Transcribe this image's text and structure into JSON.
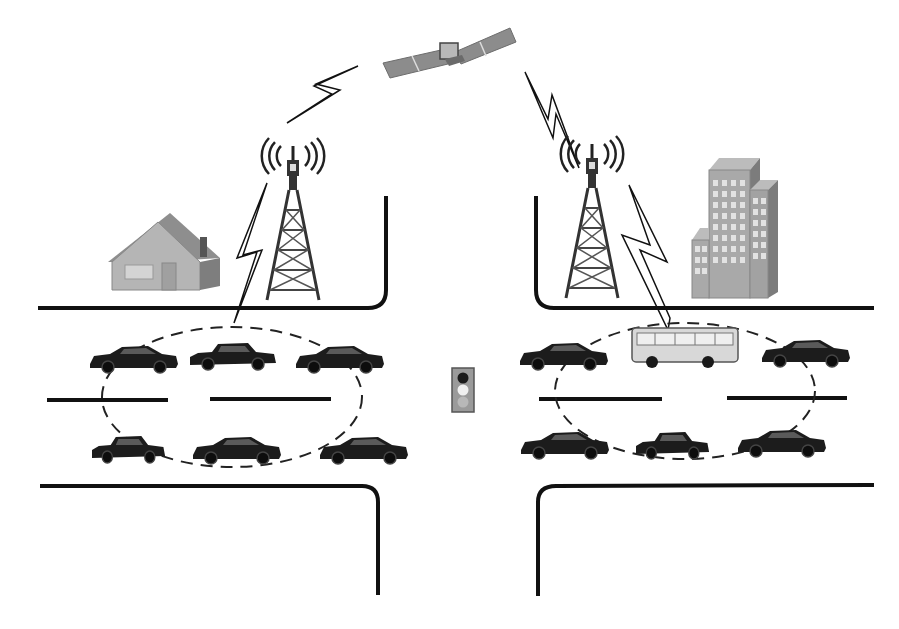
{
  "diagram": {
    "title": "",
    "colors": {
      "background": "#ffffff",
      "road": "#111111",
      "vehicle": "#1c1c1c",
      "building_face": "#a9a9a9",
      "building_side": "#7c7c7c",
      "building_window": "#e2e2e2",
      "house_wall": "#b5b5b5",
      "house_roof": "#8e8e8e",
      "satellite_panel": "#8c8c8c",
      "bus_body": "#d8d8d8",
      "cluster_outline": "#222222",
      "traffic_light_box": "#9a9a9a"
    },
    "elements": {
      "satellite": "satellite",
      "links": [
        {
          "from": "satellite",
          "to": "left-tower"
        },
        {
          "from": "satellite",
          "to": "right-tower"
        },
        {
          "from": "left-tower",
          "to": "left-vehicle-cluster"
        },
        {
          "from": "right-tower",
          "to": "right-vehicle-cluster"
        }
      ],
      "towers": [
        "left-tower",
        "right-tower"
      ],
      "buildings": [
        "house",
        "office-building"
      ],
      "traffic_light": {
        "lights": [
          "red",
          "yellow",
          "green"
        ],
        "active": "yellow"
      },
      "clusters": [
        {
          "name": "left-vehicle-cluster",
          "vehicles": [
            "car",
            "car",
            "car",
            "car",
            "car",
            "car"
          ]
        },
        {
          "name": "right-vehicle-cluster",
          "vehicles": [
            "car",
            "bus",
            "car",
            "car",
            "car",
            "car"
          ]
        }
      ]
    }
  }
}
